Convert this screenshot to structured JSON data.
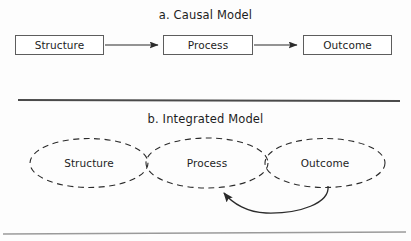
{
  "figure": {
    "background_color": "#fdfdfd",
    "stroke_color": "#2b2b2b",
    "box_border_color": "#5d5d5d",
    "text_color": "#1d1d1d"
  },
  "panel_a": {
    "title": "a. Causal Model",
    "nodes": [
      {
        "label": "Structure"
      },
      {
        "label": "Process"
      },
      {
        "label": "Outcome"
      }
    ],
    "arrows": [
      {
        "from": "Structure",
        "to": "Process"
      },
      {
        "from": "Process",
        "to": "Outcome"
      }
    ]
  },
  "panel_b": {
    "title": "b. Integrated Model",
    "nodes": [
      {
        "label": "Structure"
      },
      {
        "label": "Process"
      },
      {
        "label": "Outcome"
      }
    ],
    "feedback_arrow": {
      "from": "Outcome",
      "to": "Process"
    }
  },
  "dividers": [
    {
      "name": "divider-top"
    },
    {
      "name": "divider-bottom"
    }
  ]
}
